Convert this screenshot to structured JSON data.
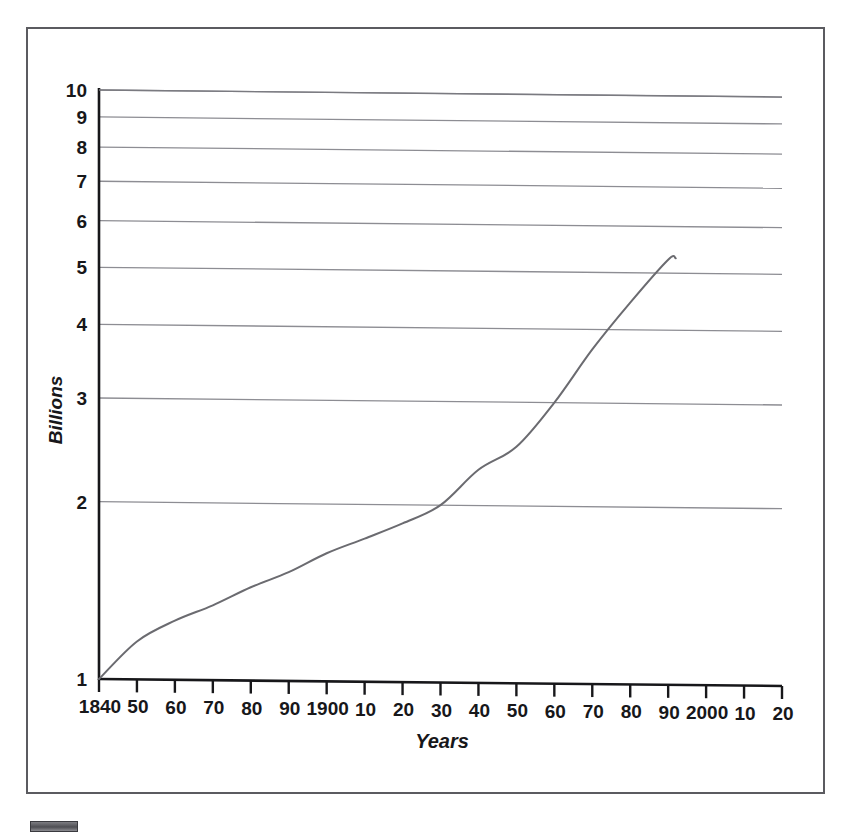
{
  "figure": {
    "background_color": "#ffffff",
    "frame_color": "#5b5b60",
    "artifact_label": "scan-artifact-block"
  },
  "chart_data": {
    "type": "line",
    "title": "",
    "subtitle": "",
    "xlabel": "Years",
    "ylabel": "Billions",
    "y_scale": "log",
    "ylim": [
      1,
      10
    ],
    "xlim": [
      1840,
      2020
    ],
    "grid": true,
    "grid_axis": "y",
    "legend_position": "none",
    "y_tick_labels": [
      "1",
      "2",
      "3",
      "4",
      "5",
      "6",
      "7",
      "8",
      "9",
      "10"
    ],
    "y_ticks": [
      1,
      2,
      3,
      4,
      5,
      6,
      7,
      8,
      9,
      10
    ],
    "x_tick_labels": [
      "1840",
      "50",
      "60",
      "70",
      "80",
      "90",
      "1900",
      "10",
      "20",
      "30",
      "40",
      "50",
      "60",
      "70",
      "80",
      "90",
      "2000",
      "10",
      "20"
    ],
    "x_ticks": [
      1840,
      1850,
      1860,
      1870,
      1880,
      1890,
      1900,
      1910,
      1920,
      1930,
      1940,
      1950,
      1960,
      1970,
      1980,
      1990,
      2000,
      2010,
      2020
    ],
    "series": [
      {
        "name": "World population",
        "color": "#6b6b70",
        "line_width": 2,
        "x": [
          1840,
          1850,
          1860,
          1870,
          1880,
          1890,
          1900,
          1910,
          1920,
          1930,
          1940,
          1950,
          1960,
          1970,
          1980,
          1990,
          1992
        ],
        "values": [
          1.0,
          1.16,
          1.26,
          1.34,
          1.44,
          1.53,
          1.65,
          1.75,
          1.86,
          2.0,
          2.3,
          2.52,
          3.0,
          3.7,
          4.45,
          5.27,
          5.3
        ]
      }
    ],
    "annotations": []
  },
  "axes": {
    "y_axis_title": "Billions",
    "x_axis_title": "Years"
  }
}
